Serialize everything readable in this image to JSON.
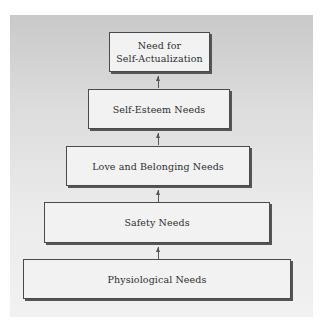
{
  "diagram": {
    "type": "hierarchy-pyramid",
    "levels": [
      {
        "label_line1": "Need for",
        "label_line2": "Self-Actualization"
      },
      {
        "label": "Self-Esteem Needs"
      },
      {
        "label": "Love and Belonging Needs"
      },
      {
        "label": "Safety Needs"
      },
      {
        "label": "Physiological Needs"
      }
    ],
    "connector": "up-arrow",
    "colors": {
      "box_fill": "#f2f2f2",
      "box_border": "#4a4a4a",
      "text": "#2e2e2e",
      "panel_top": "#c9c9c9",
      "panel_bottom": "#f1f1f1"
    }
  }
}
